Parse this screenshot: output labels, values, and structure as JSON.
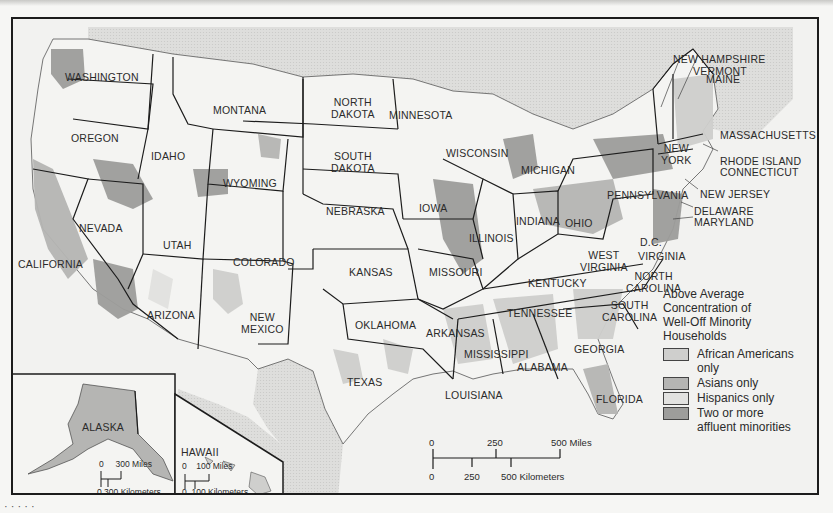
{
  "map": {
    "subject": "Above Average Concentration of Well-Off Minority Households by U.S. county",
    "colors": {
      "land": "#f4f4f2",
      "water_foreign": "#dcdcda",
      "african_americans_only": "#cfcfcd",
      "asians_only": "#b5b5b3",
      "hispanics_only": "#e2e2e0",
      "two_or_more": "#9d9d9b",
      "border": "#1c1c1c"
    },
    "states": [
      {
        "name": "WASHINGTON",
        "x": 52,
        "y": 52
      },
      {
        "name": "OREGON",
        "x": 58,
        "y": 113
      },
      {
        "name": "IDAHO",
        "x": 138,
        "y": 131
      },
      {
        "name": "MONTANA",
        "x": 200,
        "y": 85
      },
      {
        "name": "WYOMING",
        "x": 210,
        "y": 158
      },
      {
        "name": "NORTH\nDAKOTA",
        "x": 318,
        "y": 77
      },
      {
        "name": "SOUTH\nDAKOTA",
        "x": 318,
        "y": 131
      },
      {
        "name": "MINNESOTA",
        "x": 376,
        "y": 90
      },
      {
        "name": "WISCONSIN",
        "x": 433,
        "y": 128
      },
      {
        "name": "MICHIGAN",
        "x": 508,
        "y": 145
      },
      {
        "name": "NEBRASKA",
        "x": 313,
        "y": 186
      },
      {
        "name": "IOWA",
        "x": 406,
        "y": 183
      },
      {
        "name": "ILLINOIS",
        "x": 456,
        "y": 213
      },
      {
        "name": "INDIANA",
        "x": 503,
        "y": 196
      },
      {
        "name": "OHIO",
        "x": 552,
        "y": 198
      },
      {
        "name": "PENNSYLVANIA",
        "x": 594,
        "y": 170
      },
      {
        "name": "NEW\nYORK",
        "x": 648,
        "y": 123
      },
      {
        "name": "NEVADA",
        "x": 66,
        "y": 203
      },
      {
        "name": "UTAH",
        "x": 150,
        "y": 220
      },
      {
        "name": "COLORADO",
        "x": 220,
        "y": 237
      },
      {
        "name": "CALIFORNIA",
        "x": 5,
        "y": 239
      },
      {
        "name": "KANSAS",
        "x": 336,
        "y": 247
      },
      {
        "name": "MISSOURI",
        "x": 416,
        "y": 247
      },
      {
        "name": "KENTUCKY",
        "x": 515,
        "y": 258
      },
      {
        "name": "WEST\nVIRGINIA",
        "x": 567,
        "y": 230
      },
      {
        "name": "D.C.",
        "x": 627,
        "y": 217
      },
      {
        "name": "VIRGINIA",
        "x": 625,
        "y": 231
      },
      {
        "name": "NORTH\nCAROLINA",
        "x": 613,
        "y": 251
      },
      {
        "name": "TENNESSEE",
        "x": 494,
        "y": 288
      },
      {
        "name": "OKLAHOMA",
        "x": 342,
        "y": 300
      },
      {
        "name": "ARKANSAS",
        "x": 413,
        "y": 308
      },
      {
        "name": "SOUTH\nCAROLINA",
        "x": 589,
        "y": 280
      },
      {
        "name": "ARIZONA",
        "x": 134,
        "y": 290
      },
      {
        "name": "NEW\nMEXICO",
        "x": 228,
        "y": 292
      },
      {
        "name": "GEORGIA",
        "x": 561,
        "y": 324
      },
      {
        "name": "MISSISSIPPI",
        "x": 451,
        "y": 329
      },
      {
        "name": "ALABAMA",
        "x": 504,
        "y": 342
      },
      {
        "name": "TEXAS",
        "x": 334,
        "y": 357
      },
      {
        "name": "LOUISIANA",
        "x": 432,
        "y": 370
      },
      {
        "name": "FLORIDA",
        "x": 583,
        "y": 374
      },
      {
        "name": "ALASKA",
        "x": 69,
        "y": 402
      },
      {
        "name": "HAWAII",
        "x": 168,
        "y": 427
      }
    ],
    "callout_states": [
      {
        "name": "NEW HAMPSHIRE",
        "x": 660,
        "y": 34
      },
      {
        "name": "VERMONT",
        "x": 680,
        "y": 46
      },
      {
        "name": "MAINE",
        "x": 693,
        "y": 54
      },
      {
        "name": "MASSACHUSETTS",
        "x": 707,
        "y": 110
      },
      {
        "name": "RHODE ISLAND",
        "x": 707,
        "y": 136
      },
      {
        "name": "CONNECTICUT",
        "x": 707,
        "y": 147
      },
      {
        "name": "NEW JERSEY",
        "x": 687,
        "y": 169
      },
      {
        "name": "DELAWARE",
        "x": 681,
        "y": 186
      },
      {
        "name": "MARYLAND",
        "x": 681,
        "y": 197
      }
    ]
  },
  "legend": {
    "title": "Above Average\nConcentration of\nWell-Off Minority\nHouseholds",
    "items": [
      {
        "label": "African Americans\nonly",
        "color": "#cfcfcd"
      },
      {
        "label": "Asians only",
        "color": "#b5b5b3"
      },
      {
        "label": "Hispanics only",
        "color": "#e2e2e0"
      },
      {
        "label": "Two or more\naffluent minorities",
        "color": "#9d9d9b"
      }
    ]
  },
  "scale_main": {
    "miles_0": "0",
    "miles_250": "250",
    "miles_500": "500 Miles",
    "km_0": "0",
    "km_250": "250",
    "km_500": "500 Kilometers"
  },
  "scale_alaska": {
    "miles": "0     300 Miles",
    "km": "0 300 Kilometers"
  },
  "scale_hawaii": {
    "miles": "0    100 Miles",
    "km": "0  100 Kilometers"
  },
  "footer": {
    "marks": "· ·    ·   ·  ·"
  }
}
